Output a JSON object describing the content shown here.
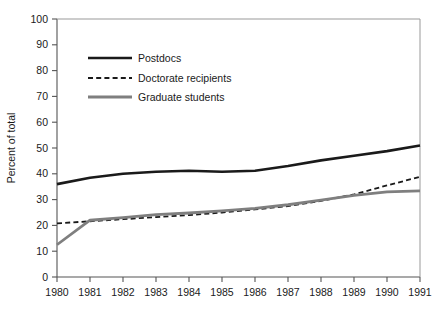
{
  "chart_data": {
    "type": "line",
    "title": "",
    "xlabel": "",
    "ylabel": "Percent of total",
    "xlim": [
      1980,
      1991
    ],
    "ylim": [
      0,
      100
    ],
    "grid": false,
    "legend_position": "upper-left-inside",
    "x": [
      1980,
      1981,
      1982,
      1983,
      1984,
      1985,
      1986,
      1987,
      1988,
      1989,
      1990,
      1991
    ],
    "xticklabels": [
      "1980",
      "1981",
      "1982",
      "1983",
      "1984",
      "1985",
      "1986",
      "1987",
      "1988",
      "1989",
      "1990",
      "1991"
    ],
    "yticklabels": [
      "0",
      "10",
      "20",
      "30",
      "40",
      "50",
      "60",
      "70",
      "80",
      "90",
      "100"
    ],
    "yticks": [
      0,
      10,
      20,
      30,
      40,
      50,
      60,
      70,
      80,
      90,
      100
    ],
    "series": [
      {
        "name": "Postdocs",
        "style": "solid",
        "color": "#1a1a1a",
        "width": 2.6,
        "values": [
          36.0,
          38.5,
          40.0,
          40.8,
          41.2,
          40.8,
          41.2,
          43.0,
          45.2,
          47.0,
          48.8,
          51.0
        ]
      },
      {
        "name": "Doctorate recipients",
        "style": "dashed",
        "color": "#1a1a1a",
        "width": 1.8,
        "values": [
          20.8,
          21.6,
          22.4,
          23.2,
          24.0,
          25.0,
          26.2,
          27.5,
          29.5,
          32.0,
          35.5,
          38.8
        ]
      },
      {
        "name": "Graduate students",
        "style": "solid",
        "color": "#7f7f7f",
        "width": 2.8,
        "values": [
          12.5,
          22.0,
          23.0,
          24.2,
          24.8,
          25.6,
          26.6,
          28.0,
          29.8,
          31.6,
          33.0,
          33.4
        ]
      }
    ]
  },
  "legend": {
    "entries": [
      {
        "label": "Postdocs"
      },
      {
        "label": "Doctorate recipients"
      },
      {
        "label": "Graduate students"
      }
    ]
  },
  "axis": {
    "ylabel": "Percent of total"
  }
}
